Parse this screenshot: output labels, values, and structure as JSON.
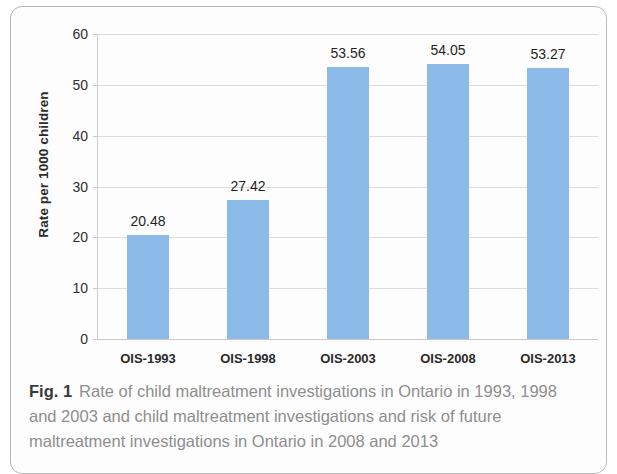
{
  "figure": {
    "caption_label": "Fig. 1",
    "caption_text": "Rate of child maltreatment investigations in Ontario in 1993, 1998 and 2003 and child maltreatment investigations and risk of future maltreatment investigations in Ontario in 2008 and 2013"
  },
  "chart_data": {
    "type": "bar",
    "title": "",
    "xlabel": "",
    "ylabel": "Rate per 1000 children",
    "categories": [
      "OIS-1993",
      "OIS-1998",
      "OIS-2003",
      "OIS-2008",
      "OIS-2013"
    ],
    "values": [
      20.48,
      27.42,
      53.56,
      54.05,
      53.27
    ],
    "value_labels": [
      "20.48",
      "27.42",
      "53.56",
      "54.05",
      "53.27"
    ],
    "ylim": [
      0,
      60
    ],
    "yticks": [
      0,
      10,
      20,
      30,
      40,
      50,
      60
    ],
    "ytick_labels": [
      "0",
      "10",
      "20",
      "30",
      "40",
      "50",
      "60"
    ],
    "grid": true,
    "legend": "none",
    "bar_color": "#8cbbea",
    "gridline_color": "#dcdcdc",
    "axis_color": "#c9c9c9"
  }
}
